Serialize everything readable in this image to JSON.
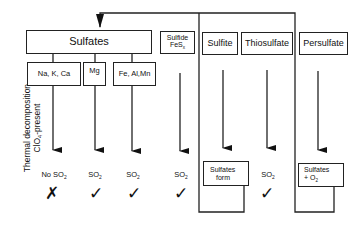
{
  "diagram": {
    "side_label": {
      "line1": "Thermal decomposition",
      "line2_prefix": "ClO",
      "line2_sub": "4",
      "line2_suffix": "-present"
    },
    "top_groups": {
      "sulfates": "Sulfates",
      "sulfide_line1": "Sulfide",
      "sulfide_line2": "FeS",
      "sulfide_sub": "x",
      "sulfite": "Sulfite",
      "thiosulfate": "Thiosulfate",
      "persulfate": "Persulfate"
    },
    "sulfate_types": [
      {
        "label": "Na, K, Ca"
      },
      {
        "label": "Mg"
      },
      {
        "label": "Fe, Al,Mn"
      }
    ],
    "outcomes": [
      {
        "text_prefix": "No SO",
        "sub": "2",
        "mark": "✗"
      },
      {
        "text_prefix": "SO",
        "sub": "2",
        "mark": "✓"
      },
      {
        "text_prefix": "SO",
        "sub": "2",
        "mark": "✓"
      },
      {
        "text_prefix": "SO",
        "sub": "2",
        "mark": "✓"
      },
      {
        "text_prefix": "SO",
        "sub": "2",
        "mark": "✓"
      }
    ],
    "result_boxes": {
      "sulfates_form_line1": "Sulfates",
      "sulfates_form_line2": "form",
      "sulfates_o2_line1": "Sulfates",
      "sulfates_o2_line2": "+ O",
      "sulfates_o2_sub": "2"
    }
  }
}
